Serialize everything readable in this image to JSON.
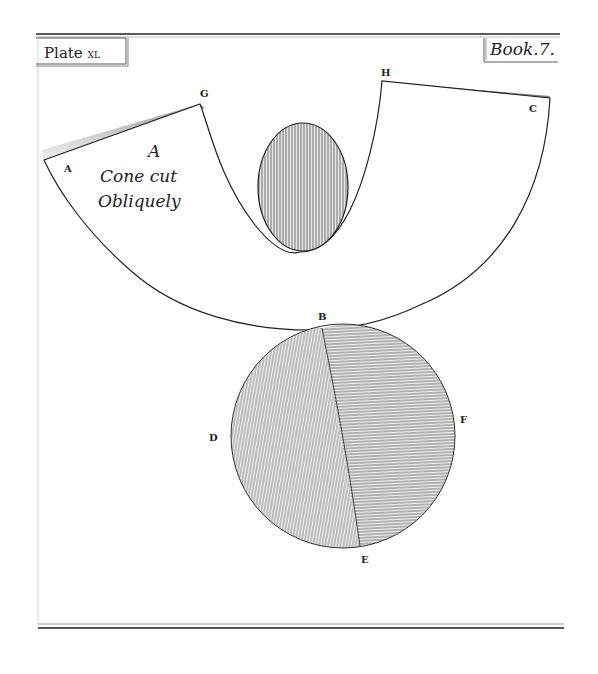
{
  "plate": {
    "plate_label": "Plate",
    "plate_number": "XL",
    "book_label": "Book.7."
  },
  "caption": {
    "line1": "A",
    "line2": "Cone cut",
    "line3": "Obliquely"
  },
  "points": {
    "A": "A",
    "G": "G",
    "H": "H",
    "C": "C",
    "B": "B",
    "D": "D",
    "E": "E",
    "F": "F"
  },
  "colors": {
    "ink": "#222222",
    "paper": "#ffffff",
    "shade": "#9a9a9a"
  }
}
